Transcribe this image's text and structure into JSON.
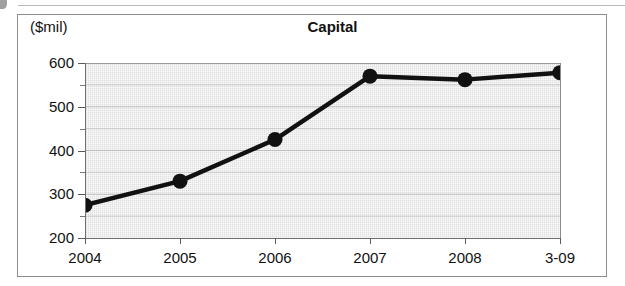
{
  "figure": {
    "y_axis_unit": "($mil)",
    "title": "Capital"
  },
  "chart_data": {
    "type": "line",
    "title": "Capital",
    "xlabel": "",
    "ylabel": "($mil)",
    "categories": [
      "2004",
      "2005",
      "2006",
      "2007",
      "2008",
      "3-09"
    ],
    "values": [
      275,
      330,
      425,
      570,
      562,
      578
    ],
    "series": [
      {
        "name": "Capital",
        "values": [
          275,
          330,
          425,
          570,
          562,
          578
        ]
      }
    ],
    "ylim": [
      200,
      600
    ],
    "yticks": [
      200,
      300,
      400,
      500,
      600
    ],
    "ytick_labels": [
      "200",
      "300",
      "400",
      "500",
      "600"
    ],
    "yminor_ticks": [
      250,
      350,
      450,
      550
    ],
    "grid": true,
    "legend": "none",
    "line_color": "#111111",
    "marker": "circle",
    "marker_color": "#111111",
    "plot_background": "#dedede"
  },
  "y_axis": {
    "labels": [
      "600",
      "500",
      "400",
      "300",
      "200"
    ]
  },
  "x_axis": {
    "labels": [
      "2004",
      "2005",
      "2006",
      "2007",
      "2008",
      "3-09"
    ]
  }
}
